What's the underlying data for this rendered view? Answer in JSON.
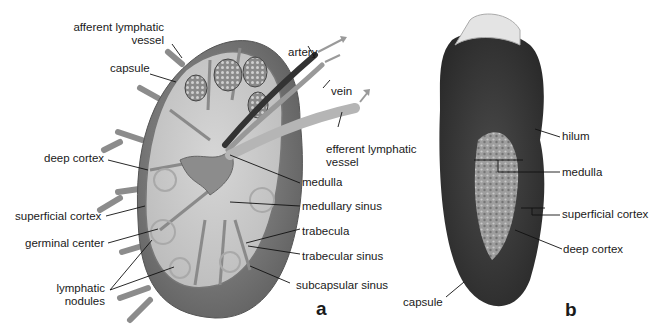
{
  "figure": {
    "panel_a": {
      "letter": "a",
      "labels": {
        "afferent_line1": "afferent lymphatic",
        "afferent_line2": "vessel",
        "capsule": "capsule",
        "deep_cortex": "deep cortex",
        "superficial_cortex": "superficial cortex",
        "germinal_center": "germinal center",
        "lymphatic_line1": "lymphatic",
        "lymphatic_line2": "nodules",
        "artery": "artery",
        "vein": "vein",
        "efferent_line1": "efferent lymphatic",
        "efferent_line2": "vessel",
        "medulla": "medulla",
        "medullary_sinus": "medullary sinus",
        "trabecula": "trabecula",
        "trabecular_sinus": "trabecular sinus",
        "subcapsular_sinus": "subcapsular sinus"
      }
    },
    "panel_b": {
      "letter": "b",
      "labels": {
        "hilum": "hilum",
        "medulla": "medulla",
        "superficial_cortex": "superficial cortex",
        "deep_cortex": "deep cortex",
        "capsule": "capsule"
      }
    },
    "colors": {
      "background": "#ffffff",
      "node_fill": "#c9c9c9",
      "capsule_dark": "#6e6e6e",
      "artery": "#3a3a3a",
      "vein": "#9a9a9a",
      "tissue_dark": "#3c3c3c",
      "tissue_light": "#b8b8b8"
    }
  }
}
